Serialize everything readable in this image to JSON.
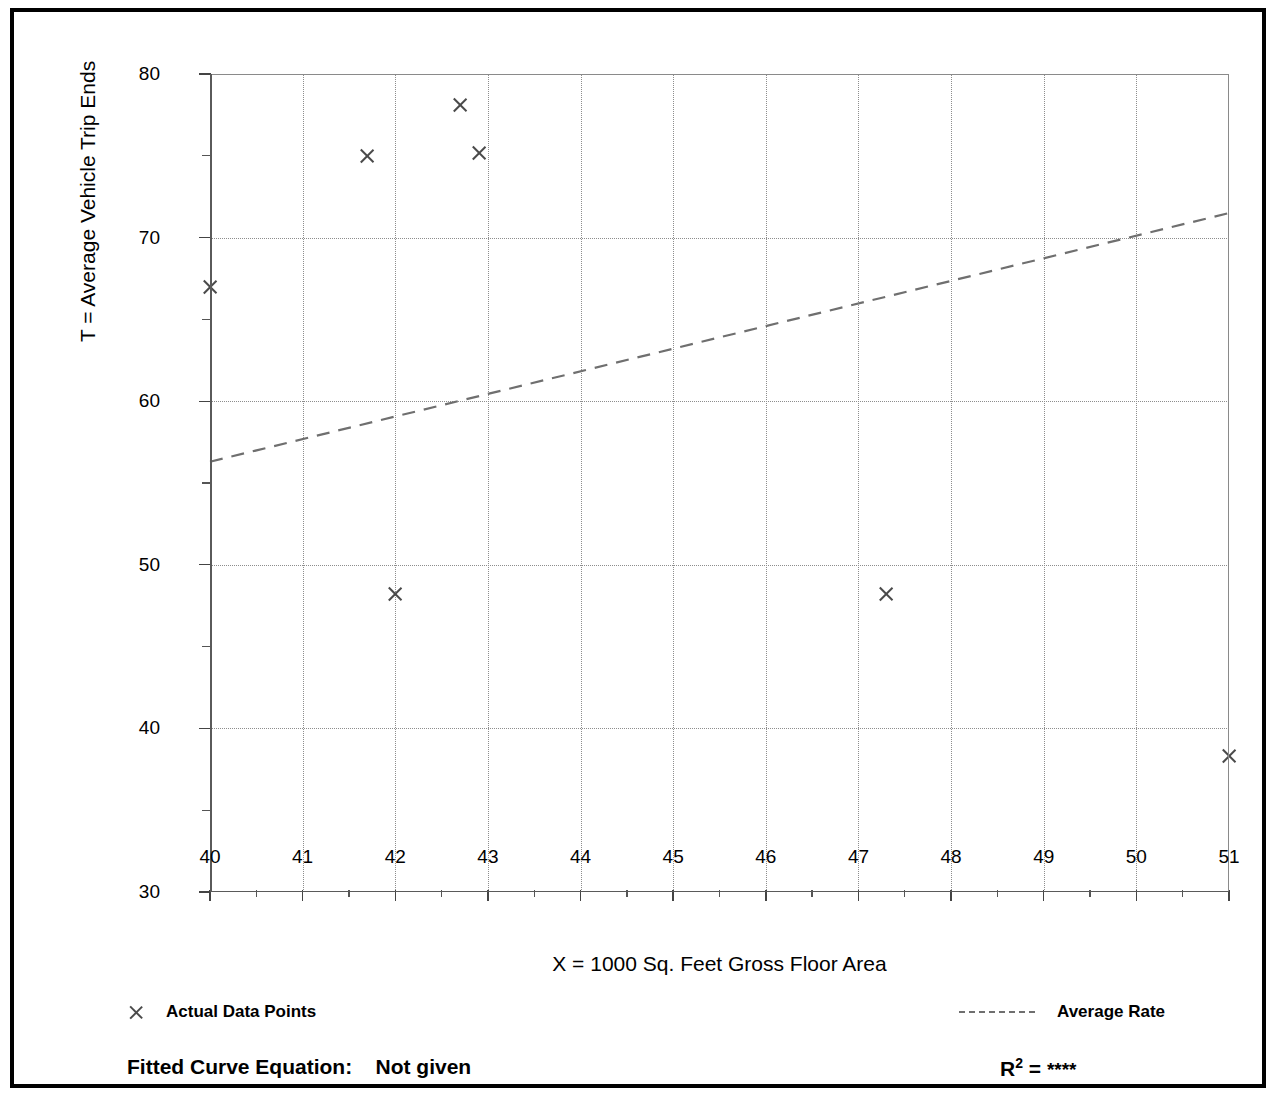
{
  "chart_data": {
    "type": "scatter",
    "title": "",
    "xlabel": "X = 1000 Sq. Feet Gross Floor Area",
    "ylabel": "T = Average Vehicle Trip Ends",
    "xlim": [
      40,
      51
    ],
    "ylim": [
      30,
      80
    ],
    "xticks": [
      40,
      41,
      42,
      43,
      44,
      45,
      46,
      47,
      48,
      49,
      50,
      51
    ],
    "xtick_labels": [
      "40",
      "41",
      "42",
      "43",
      "44",
      "45",
      "46",
      "47",
      "48",
      "49",
      "50",
      "51"
    ],
    "xminor_step": 0.5,
    "yticks": [
      30,
      40,
      50,
      60,
      70,
      80
    ],
    "ytick_labels": [
      "30",
      "40",
      "50",
      "60",
      "70",
      "80"
    ],
    "yminor_step": 5,
    "grid": "dotted-both",
    "legend_position": "below-plot",
    "series": [
      {
        "name": "Actual Data Points",
        "marker": "x",
        "points": [
          {
            "x": 40.0,
            "y": 67.0
          },
          {
            "x": 41.7,
            "y": 75.0
          },
          {
            "x": 42.0,
            "y": 48.2
          },
          {
            "x": 42.7,
            "y": 78.1
          },
          {
            "x": 42.9,
            "y": 75.2
          },
          {
            "x": 47.3,
            "y": 48.2
          },
          {
            "x": 51.0,
            "y": 38.3
          }
        ]
      },
      {
        "name": "Average Rate",
        "style": "dashed-line",
        "points": [
          {
            "x": 40.0,
            "y": 56.3
          },
          {
            "x": 51.0,
            "y": 71.5
          }
        ]
      }
    ]
  },
  "legend": {
    "data_points_label": "Actual Data Points",
    "average_rate_label": "Average Rate",
    "marker_icon": "x-marker-icon",
    "line_icon": "dashed-line-icon"
  },
  "footer": {
    "equation_label": "Fitted Curve Equation:",
    "equation_value": "Not given",
    "r2_symbol": "R",
    "r2_exponent": "2",
    "r2_equals": "=",
    "r2_value": "****"
  },
  "colors": {
    "marker": "#4a4a4a",
    "grid": "#8d8d8d",
    "axis": "#5a5a5a",
    "trend": "#6f6f6f",
    "frame": "#000000",
    "text": "#000000"
  }
}
